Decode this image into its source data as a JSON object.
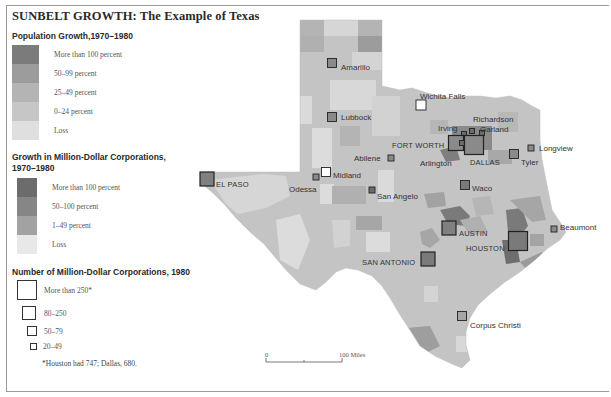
{
  "title": "SUNBELT GROWTH: The Example of Texas",
  "legend": {
    "population": {
      "heading": "Population Growth,1970–1980",
      "items": [
        {
          "label": "More than 100 percent",
          "color": "#7b7b7b"
        },
        {
          "label": "50–99 percent",
          "color": "#9c9c9c"
        },
        {
          "label": "25–49 percent",
          "color": "#b4b4b4"
        },
        {
          "label": "0–24 percent",
          "color": "#c6c6c6"
        },
        {
          "label": "Loss",
          "color": "#dfdfdf"
        }
      ]
    },
    "corporations_growth": {
      "heading_line1": "Growth in Million-Dollar Corporations,",
      "heading_line2": "1970–1980",
      "items": [
        {
          "label": "More than 100 percent",
          "color": "#6c6c6c"
        },
        {
          "label": "50–100 percent",
          "color": "#868686"
        },
        {
          "label": "1–49 percent",
          "color": "#a2a2a2"
        },
        {
          "label": "Loss",
          "color": "#e8e8e8"
        }
      ]
    },
    "corporations_count": {
      "heading": "Number of Million-Dollar Corporations, 1980",
      "items": [
        {
          "label": "More than 250*",
          "size": 20
        },
        {
          "label": "80–250",
          "size": 15
        },
        {
          "label": "50–79",
          "size": 10
        },
        {
          "label": "20–49",
          "size": 7
        }
      ],
      "footnote": "*Houston had 747; Dallas, 680."
    }
  },
  "scale_bar": {
    "start": "0",
    "end": "100 Miles"
  },
  "cities": [
    {
      "name": "Amarillo",
      "x": 332,
      "y": 63,
      "size": 9,
      "fill": "#8a8a8a",
      "lx": 341,
      "ly": 67
    },
    {
      "name": "Lubbock",
      "x": 332,
      "y": 117,
      "size": 9,
      "fill": "#8a8a8a",
      "lx": 341,
      "ly": 117
    },
    {
      "name": "Wichita Falls",
      "x": 421,
      "y": 105,
      "size": 10,
      "fill": "#ffffff",
      "lx": 420,
      "ly": 96
    },
    {
      "name": "Richardson",
      "x": 472,
      "y": 131,
      "size": 5,
      "fill": "#6c6c6c",
      "lx": 473,
      "ly": 119
    },
    {
      "name": "Irving",
      "x": 464,
      "y": 134,
      "size": 5,
      "fill": "#6c6c6c",
      "lx": 438,
      "ly": 128
    },
    {
      "name": "Garland",
      "x": 482,
      "y": 133,
      "size": 5,
      "fill": "#6c6c6c",
      "lx": 480,
      "ly": 129
    },
    {
      "name": "FORT WORTH",
      "x": 456,
      "y": 143,
      "size": 15,
      "fill": "#8a8a8a",
      "lx": 392,
      "ly": 145,
      "caps": true
    },
    {
      "name": "Arlington",
      "x": 462,
      "y": 143,
      "size": 5,
      "fill": "#6c6c6c",
      "lx": 420,
      "ly": 163
    },
    {
      "name": "DALLAS",
      "x": 474,
      "y": 145,
      "size": 19,
      "fill": "#8a8a8a",
      "lx": 470,
      "ly": 162,
      "caps": true
    },
    {
      "name": "Longview",
      "x": 531,
      "y": 148,
      "size": 6,
      "fill": "#8a8a8a",
      "lx": 539,
      "ly": 148
    },
    {
      "name": "Tyler",
      "x": 514,
      "y": 154,
      "size": 9,
      "fill": "#8a8a8a",
      "lx": 521,
      "ly": 162
    },
    {
      "name": "Abilene",
      "x": 391,
      "y": 158,
      "size": 6,
      "fill": "#8a8a8a",
      "lx": 354,
      "ly": 158
    },
    {
      "name": "Midland",
      "x": 326,
      "y": 172,
      "size": 9,
      "fill": "#ffffff",
      "lx": 333,
      "ly": 175
    },
    {
      "name": "Odessa",
      "x": 316,
      "y": 177,
      "size": 6,
      "fill": "#8a8a8a",
      "lx": 289,
      "ly": 189
    },
    {
      "name": "EL PASO",
      "x": 207,
      "y": 179,
      "size": 14,
      "fill": "#808080",
      "lx": 216,
      "ly": 184,
      "caps": true
    },
    {
      "name": "Waco",
      "x": 465,
      "y": 185,
      "size": 9,
      "fill": "#7a7a7a",
      "lx": 472,
      "ly": 188
    },
    {
      "name": "San Angelo",
      "x": 372,
      "y": 190,
      "size": 6,
      "fill": "#6c6c6c",
      "lx": 377,
      "ly": 196
    },
    {
      "name": "AUSTIN",
      "x": 449,
      "y": 228,
      "size": 14,
      "fill": "#808080",
      "lx": 459,
      "ly": 233,
      "caps": true
    },
    {
      "name": "Beaumont",
      "x": 554,
      "y": 229,
      "size": 6,
      "fill": "#8a8a8a",
      "lx": 560,
      "ly": 227
    },
    {
      "name": "HOUSTON",
      "x": 518,
      "y": 241,
      "size": 19,
      "fill": "#7a7a7a",
      "lx": 466,
      "ly": 248,
      "caps": true
    },
    {
      "name": "SAN ANTONIO",
      "x": 428,
      "y": 259,
      "size": 14,
      "fill": "#7a7a7a",
      "lx": 362,
      "ly": 262,
      "caps": true
    },
    {
      "name": "Corpus Christi",
      "x": 462,
      "y": 316,
      "size": 9,
      "fill": "#a6a6a6",
      "lx": 470,
      "ly": 325
    }
  ]
}
